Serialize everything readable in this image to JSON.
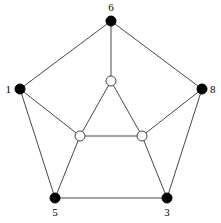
{
  "diagram": {
    "type": "graph",
    "nodes": [
      {
        "id": "v6",
        "label": "6",
        "x": 111,
        "y": 21,
        "filled": true,
        "label_x": 111,
        "label_y": 11,
        "anchor": "middle"
      },
      {
        "id": "v1",
        "label": "1",
        "x": 20,
        "y": 89,
        "filled": true,
        "label_x": 11,
        "label_y": 93,
        "anchor": "end"
      },
      {
        "id": "v8",
        "label": "8",
        "x": 202,
        "y": 89,
        "filled": true,
        "label_x": 210,
        "label_y": 93,
        "anchor": "start"
      },
      {
        "id": "v5",
        "label": "5",
        "x": 55,
        "y": 198,
        "filled": true,
        "label_x": 55,
        "label_y": 216,
        "anchor": "middle"
      },
      {
        "id": "v3",
        "label": "3",
        "x": 167,
        "y": 198,
        "filled": true,
        "label_x": 167,
        "label_y": 216,
        "anchor": "middle"
      },
      {
        "id": "inTop",
        "label": "",
        "x": 111,
        "y": 81,
        "filled": false
      },
      {
        "id": "inLeft",
        "label": "",
        "x": 80,
        "y": 136,
        "filled": false
      },
      {
        "id": "inRight",
        "label": "",
        "x": 142,
        "y": 136,
        "filled": false
      }
    ],
    "edges": [
      [
        "v6",
        "v1"
      ],
      [
        "v6",
        "v8"
      ],
      [
        "v1",
        "v5"
      ],
      [
        "v8",
        "v3"
      ],
      [
        "v5",
        "v3"
      ],
      [
        "v6",
        "inTop"
      ],
      [
        "v1",
        "inLeft"
      ],
      [
        "v8",
        "inRight"
      ],
      [
        "v5",
        "inLeft"
      ],
      [
        "v3",
        "inRight"
      ],
      [
        "inTop",
        "inLeft"
      ],
      [
        "inTop",
        "inRight"
      ],
      [
        "inLeft",
        "inRight"
      ]
    ],
    "node_radius": 5,
    "colors": {
      "filled": "#000000",
      "hollow_fill": "#ffffff",
      "edge": "#333333"
    }
  }
}
